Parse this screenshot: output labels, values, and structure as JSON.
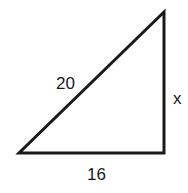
{
  "figure": {
    "type": "right-triangle",
    "labels": {
      "hypotenuse": "20",
      "vertical_side": "x",
      "base": "16"
    },
    "stroke_color": "#1a1a1a",
    "background": "#ffffff"
  }
}
